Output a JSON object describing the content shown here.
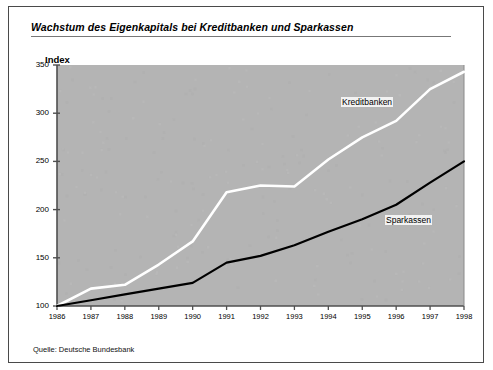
{
  "figure": {
    "title": "Wachstum des Eigenkapitals bei Kreditbanken und Sparkassen",
    "axis_title": "Index",
    "source": "Quelle: Deutsche Bundesbank",
    "plot_background": "#b4b4b4",
    "frame_color": "#4a4a4a"
  },
  "chart_data": {
    "type": "line",
    "title": "Wachstum des Eigenkapitals bei Kreditbanken und Sparkassen",
    "xlabel": "",
    "ylabel": "Index",
    "ylim": [
      100,
      350
    ],
    "yticks": [
      100,
      150,
      200,
      250,
      300,
      350
    ],
    "xlim": [
      1986,
      1998
    ],
    "grid": false,
    "legend_position": "inline-annotations",
    "annotations": [
      "Kreditbanken",
      "Sparkassen"
    ],
    "source": "Quelle: Deutsche Bundesbank",
    "categories": [
      1986,
      1987,
      1988,
      1989,
      1990,
      1991,
      1992,
      1993,
      1994,
      1995,
      1996,
      1997,
      1998
    ],
    "x": [
      "1986",
      "1987",
      "1988",
      "1989",
      "1990",
      "1991",
      "1992",
      "1993",
      "1994",
      "1995",
      "1996",
      "1997",
      "1998"
    ],
    "series": [
      {
        "name": "Kreditbanken",
        "color": "#ffffff",
        "values": [
          100,
          118,
          122,
          143,
          167,
          218,
          225,
          224,
          252,
          275,
          292,
          325,
          343
        ]
      },
      {
        "name": "Sparkassen",
        "color": "#000000",
        "values": [
          100,
          106,
          112,
          118,
          124,
          145,
          152,
          163,
          177,
          190,
          205,
          228,
          250
        ]
      }
    ]
  }
}
